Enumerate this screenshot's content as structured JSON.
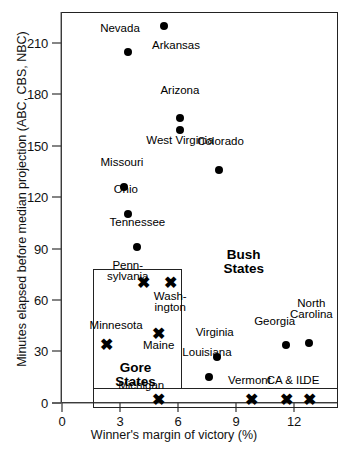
{
  "chart_data": {
    "type": "scatter",
    "title": "",
    "xlabel": "Winner's margin of victory (%)",
    "ylabel": "Minutes elapsed before median projection (ABC, CBS, NBC)",
    "xlim": [
      0,
      13.8
    ],
    "ylim": [
      0,
      228
    ],
    "xticks": [
      0,
      3,
      6,
      9,
      12
    ],
    "xticklabels": [
      "0",
      "3",
      "6",
      "9",
      "12"
    ],
    "yticks": [
      0,
      30,
      60,
      90,
      120,
      150,
      180,
      210
    ],
    "yticklabels": [
      "0",
      "30",
      "60",
      "90",
      "120",
      "150",
      "180",
      "210"
    ],
    "grid": false,
    "legend": "none",
    "series": [
      {
        "name": "Bush States",
        "marker": "filled-circle",
        "points": [
          {
            "label": "Arkansas",
            "x": 5.3,
            "y": 220,
            "lx": 5.9,
            "ly": 208,
            "align": "center"
          },
          {
            "label": "Nevada",
            "x": 3.4,
            "y": 205,
            "lx": 3.0,
            "ly": 218,
            "align": "center"
          },
          {
            "label": "Arizona",
            "x": 6.1,
            "y": 166,
            "lx": 6.1,
            "ly": 182,
            "align": "center"
          },
          {
            "label": "West Virginia",
            "x": 6.1,
            "y": 159,
            "lx": 6.1,
            "ly": 153,
            "align": "center"
          },
          {
            "label": "Colorado",
            "x": 8.1,
            "y": 136,
            "lx": 8.2,
            "ly": 152,
            "align": "center"
          },
          {
            "label": "Missouri",
            "x": 3.2,
            "y": 126,
            "lx": 3.1,
            "ly": 140,
            "align": "center"
          },
          {
            "label": "Ohio",
            "x": 3.4,
            "y": 110,
            "lx": 3.3,
            "ly": 124,
            "align": "center"
          },
          {
            "label": "Tennessee",
            "x": 3.9,
            "y": 91,
            "lx": 3.9,
            "ly": 105,
            "align": "center"
          },
          {
            "label": "Georgia",
            "x": 11.6,
            "y": 34,
            "lx": 11.0,
            "ly": 47,
            "align": "center"
          },
          {
            "label": "North\nCarolina",
            "x": 12.8,
            "y": 35,
            "lx": 12.9,
            "ly": 58,
            "align": "center"
          },
          {
            "label": "Virginia",
            "x": 8.0,
            "y": 27,
            "lx": 7.9,
            "ly": 41,
            "align": "center"
          },
          {
            "label": "Louisiana",
            "x": 7.6,
            "y": 15,
            "lx": 7.5,
            "ly": 29,
            "align": "center"
          }
        ]
      },
      {
        "name": "Gore States",
        "marker": "x-cross",
        "points": [
          {
            "label": "Penn-\nsylvania",
            "x": 4.2,
            "y": 70,
            "lx": 3.4,
            "ly": 80,
            "align": "center"
          },
          {
            "label": "Wash-\nington",
            "x": 5.6,
            "y": 70,
            "lx": 5.6,
            "ly": 62,
            "align": "center"
          },
          {
            "label": "Maine",
            "x": 5.0,
            "y": 40,
            "lx": 5.0,
            "ly": 33,
            "align": "center"
          },
          {
            "label": "Minnesota",
            "x": 2.3,
            "y": 34,
            "lx": 2.8,
            "ly": 45,
            "align": "center"
          },
          {
            "label": "Michigan",
            "x": 5.0,
            "y": 2,
            "lx": 4.1,
            "ly": 10,
            "align": "center"
          },
          {
            "label": "Vermont",
            "x": 9.8,
            "y": 2,
            "lx": 9.7,
            "ly": 13,
            "align": "center"
          },
          {
            "label": "CA & IL",
            "x": 11.6,
            "y": 2,
            "lx": 11.6,
            "ly": 13,
            "align": "center"
          },
          {
            "label": "DE",
            "x": 12.8,
            "y": 2,
            "lx": 12.9,
            "ly": 13,
            "align": "center"
          }
        ]
      }
    ],
    "annotations": [
      {
        "name": "bush-states-label",
        "text": "Bush\nStates",
        "x": 9.4,
        "y": 86
      },
      {
        "name": "gore-states-label",
        "text": "Gore\nStates",
        "x": 3.8,
        "y": 20
      }
    ],
    "region_boxes": [
      {
        "name": "gore-region-box-upper",
        "x0": 1.6,
        "x1": 6.2,
        "y0": 8,
        "y1": 78
      },
      {
        "name": "gore-region-box-lower",
        "x0": 1.6,
        "x1": 14.3,
        "y0": -3,
        "y1": 9
      }
    ]
  },
  "axis": {
    "x_title": "Winner's margin of victory (%)",
    "y_title": "Minutes elapsed before median projection (ABC, CBS, NBC)"
  }
}
